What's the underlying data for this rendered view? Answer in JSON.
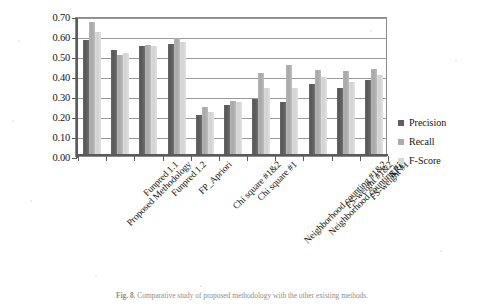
{
  "figure": {
    "caption_label": "Fig. 8.",
    "caption_text": "Comparative study of proposed methodology with the other existing methods."
  },
  "legend": {
    "position": "right",
    "items": [
      {
        "label": "Precision",
        "color": "#5e5e5e"
      },
      {
        "label": "Recall",
        "color": "#ababab"
      },
      {
        "label": "F-Score",
        "color": "#d8d8d8"
      }
    ]
  },
  "axis": {
    "y_ticks": [
      "0.00",
      "0.10",
      "0.20",
      "0.30",
      "0.40",
      "0.50",
      "0.60",
      "0.70"
    ]
  },
  "chart_data": {
    "type": "bar",
    "title": "",
    "subtitle": "",
    "xlabel": "",
    "ylabel": "",
    "ylim": [
      0.0,
      0.7
    ],
    "ytick_step": 0.1,
    "grid": true,
    "legend_position": "right",
    "categories": [
      "Proposed Methodology",
      "Funpred 1.1",
      "Funpred 1.2",
      "FP_Apriori",
      "Chi square #1&2",
      "Chi square #1",
      "Neighborhood counting #1&2",
      "Neighborhood counting #1",
      "FS-weight #1&2",
      "FS-weight #1",
      "NRC"
    ],
    "series": [
      {
        "name": "Precision",
        "color": "#5e5e5e",
        "values": [
          0.58,
          0.53,
          0.55,
          0.56,
          0.2,
          0.25,
          0.28,
          0.265,
          0.355,
          0.335,
          0.375
        ]
      },
      {
        "name": "Recall",
        "color": "#ababab",
        "values": [
          0.67,
          0.5,
          0.555,
          0.59,
          0.24,
          0.27,
          0.41,
          0.45,
          0.425,
          0.42,
          0.43
        ]
      },
      {
        "name": "F-Score",
        "color": "#d8d8d8",
        "values": [
          0.62,
          0.51,
          0.55,
          0.57,
          0.215,
          0.265,
          0.335,
          0.335,
          0.39,
          0.365,
          0.4
        ]
      }
    ]
  }
}
